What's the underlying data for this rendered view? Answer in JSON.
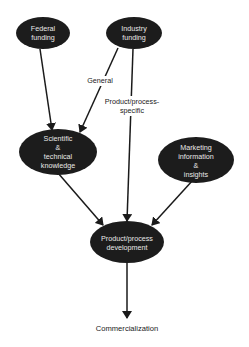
{
  "diagram": {
    "type": "flow",
    "nodes": [
      {
        "id": "federal",
        "lines": [
          "Federal",
          "funding"
        ]
      },
      {
        "id": "industry",
        "lines": [
          "Industry",
          "funding"
        ]
      },
      {
        "id": "scientific",
        "lines": [
          "Scientific",
          "&",
          "technical",
          "knowledge"
        ]
      },
      {
        "id": "marketing",
        "lines": [
          "Marketing",
          "information",
          "&",
          "insights"
        ]
      },
      {
        "id": "product",
        "lines": [
          "Product/process",
          "development"
        ]
      }
    ],
    "terminal": {
      "id": "commercialization",
      "label": "Commercialization"
    },
    "edges": [
      {
        "from": "federal",
        "to": "scientific",
        "label": ""
      },
      {
        "from": "industry",
        "to": "scientific",
        "label": "General"
      },
      {
        "from": "industry",
        "to": "product",
        "label_lines": [
          "Product/process-",
          "specific"
        ]
      },
      {
        "from": "scientific",
        "to": "product",
        "label": ""
      },
      {
        "from": "marketing",
        "to": "product",
        "label": ""
      },
      {
        "from": "product",
        "to": "commercialization",
        "label": ""
      }
    ],
    "edge_labels": {
      "general": "General",
      "specific_line1": "Product/process-",
      "specific_line2": "specific"
    }
  }
}
